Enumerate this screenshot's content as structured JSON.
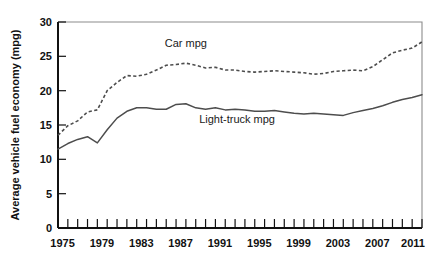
{
  "chart_data": {
    "type": "line",
    "title": "",
    "xlabel": "",
    "ylabel": "Average vehicle fuel economy (mpg)",
    "xlim": [
      1975,
      2012
    ],
    "ylim": [
      0,
      30
    ],
    "grid": false,
    "legend_position": "inline-annotations",
    "x_tick_labels": [
      "1975",
      "1979",
      "1983",
      "1987",
      "1991",
      "1995",
      "1999",
      "2003",
      "2007",
      "2011"
    ],
    "x_tick_values": [
      1975,
      1979,
      1983,
      1987,
      1991,
      1995,
      1999,
      2003,
      2007,
      2011
    ],
    "x_minor_tick_interval": 1,
    "y_tick_labels": [
      "0",
      "5",
      "10",
      "15",
      "20",
      "25",
      "30"
    ],
    "y_tick_values": [
      0,
      5,
      10,
      15,
      20,
      25,
      30
    ],
    "x": [
      1975,
      1976,
      1977,
      1978,
      1979,
      1980,
      1981,
      1982,
      1983,
      1984,
      1985,
      1986,
      1987,
      1988,
      1989,
      1990,
      1991,
      1992,
      1993,
      1994,
      1995,
      1996,
      1997,
      1998,
      1999,
      2000,
      2001,
      2002,
      2003,
      2004,
      2005,
      2006,
      2007,
      2008,
      2009,
      2010,
      2011,
      2012
    ],
    "series": [
      {
        "name": "Car mpg",
        "style": "dashed",
        "color": "#4d4d4d",
        "label_text": "Car mpg",
        "label_x": 1988.0,
        "label_y": 26.4,
        "values": [
          13.5,
          14.9,
          15.6,
          16.9,
          17.2,
          20.0,
          21.2,
          22.2,
          22.1,
          22.4,
          23.0,
          23.7,
          23.8,
          24.0,
          23.7,
          23.3,
          23.4,
          23.0,
          23.0,
          22.8,
          22.7,
          22.8,
          22.9,
          22.8,
          22.7,
          22.6,
          22.4,
          22.5,
          22.8,
          22.9,
          23.0,
          22.9,
          23.5,
          24.5,
          25.5,
          25.9,
          26.2,
          27.1
        ]
      },
      {
        "name": "Light-truck mpg",
        "style": "solid",
        "color": "#4d4d4d",
        "label_text": "Light-truck mpg",
        "label_x": 1993.2,
        "label_y": 15.3,
        "values": [
          11.5,
          12.3,
          12.9,
          13.3,
          12.4,
          14.3,
          16.0,
          17.0,
          17.5,
          17.5,
          17.3,
          17.3,
          18.0,
          18.1,
          17.5,
          17.3,
          17.5,
          17.2,
          17.3,
          17.2,
          17.0,
          17.0,
          17.1,
          16.9,
          16.7,
          16.6,
          16.7,
          16.6,
          16.5,
          16.4,
          16.8,
          17.1,
          17.4,
          17.8,
          18.3,
          18.7,
          19.0,
          19.4
        ]
      }
    ]
  },
  "figure": {
    "background_color": "#ffffff",
    "axis_color": "#111111",
    "border_color": "#8c8c8c",
    "line_color": "#4d4d4d"
  }
}
